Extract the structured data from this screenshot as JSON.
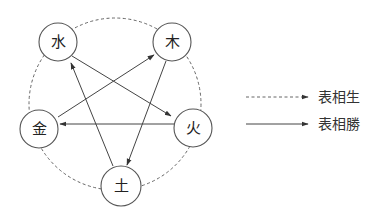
{
  "diagram": {
    "nodes": [
      {
        "id": "water",
        "label": "水",
        "x": 58,
        "y": 42
      },
      {
        "id": "wood",
        "label": "木",
        "x": 172,
        "y": 42
      },
      {
        "id": "metal",
        "label": "金",
        "x": 39,
        "y": 129
      },
      {
        "id": "fire",
        "label": "火",
        "x": 193,
        "y": 128
      },
      {
        "id": "earth",
        "label": "土",
        "x": 121,
        "y": 186
      }
    ],
    "generating_cycle": [
      "水",
      "木",
      "火",
      "土",
      "金"
    ],
    "overcoming_edges": [
      {
        "from": "水",
        "to": "火"
      },
      {
        "from": "火",
        "to": "金"
      },
      {
        "from": "金",
        "to": "木"
      },
      {
        "from": "木",
        "to": "土"
      },
      {
        "from": "土",
        "to": "水"
      }
    ],
    "colors": {
      "line": "#444444",
      "dashed": "#666666",
      "background": "#ffffff"
    }
  },
  "legend": {
    "items": [
      {
        "style": "dashed",
        "label": "表相生"
      },
      {
        "style": "solid",
        "label": "表相勝"
      }
    ]
  }
}
